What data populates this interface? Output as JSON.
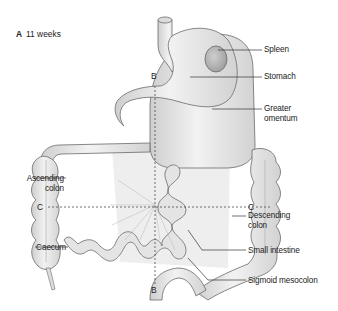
{
  "figure": {
    "panel_letter": "A",
    "panel_title": "11 weeks",
    "section_lines": {
      "vertical": "B",
      "vertical_bottom": "B",
      "horizontal_left": "C",
      "horizontal_right": "C"
    },
    "labels": {
      "spleen": "Spleen",
      "stomach": "Stomach",
      "greater_omentum_1": "Greater",
      "greater_omentum_2": "omentum",
      "ascending_colon_1": "Ascending",
      "ascending_colon_2": "colon",
      "caecum": "Caecum",
      "descending_colon_1": "Descending",
      "descending_colon_2": "colon",
      "small_intestine": "Small intestine",
      "sigmoid_mesocolon": "Sigmoid mesocolon"
    },
    "colors": {
      "organ_fill": "#e8e8e8",
      "organ_stroke": "#6a6a6a",
      "spleen_fill": "#b8b8b8",
      "text": "#222222"
    }
  }
}
